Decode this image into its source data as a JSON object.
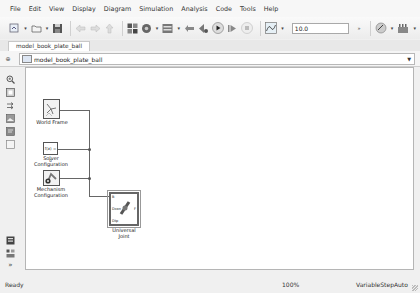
{
  "menubar": {
    "items": [
      {
        "label": "File",
        "mnemonic": "F"
      },
      {
        "label": "Edit",
        "mnemonic": "E"
      },
      {
        "label": "View",
        "mnemonic": "V"
      },
      {
        "label": "Display",
        "mnemonic": "D"
      },
      {
        "label": "Diagram",
        "mnemonic": "g"
      },
      {
        "label": "Simulation",
        "mnemonic": "S"
      },
      {
        "label": "Analysis",
        "mnemonic": "A"
      },
      {
        "label": "Code",
        "mnemonic": "C"
      },
      {
        "label": "Tools",
        "mnemonic": "T"
      },
      {
        "label": "Help",
        "mnemonic": "H"
      }
    ]
  },
  "toolbar": {
    "icons": [
      "new-model-icon",
      "open-icon",
      "save-icon",
      "back-icon",
      "forward-icon",
      "up-icon",
      "library-browser-icon",
      "model-config-icon",
      "model-explorer-icon",
      "step-back-icon",
      "step-back-alt-icon",
      "run-icon",
      "step-forward-icon",
      "stop-icon",
      "data-inspector-icon",
      "fast-restart-icon",
      "build-icon"
    ],
    "stop_time": "10.0"
  },
  "tabs": [
    {
      "label": "model_book_plate_ball",
      "active": true
    }
  ],
  "address_bar": {
    "path": "model_book_plate_ball"
  },
  "palette": {
    "top_icons": [
      "zoom-icon",
      "fit-view-icon",
      "arrow-icon",
      "image-icon",
      "annotation-icon",
      "area-icon"
    ],
    "bottom_icons": [
      "model-browser-icon",
      "property-inspector-icon",
      "expand-icon"
    ],
    "expand_glyph": "»"
  },
  "blocks": {
    "world_frame": {
      "label": "World Frame"
    },
    "solver": {
      "label_line1": "Solver",
      "label_line2": "Configuration",
      "content": "f(x) = 0"
    },
    "mechanism": {
      "label_line1": "Mechanism",
      "label_line2": "Configuration"
    },
    "universal_joint": {
      "label_line1": "Universal",
      "label_line2": "Joint",
      "port_b": "B",
      "port_f": "F",
      "port_dcon": "Dcon",
      "port_dtp": "Dtp"
    }
  },
  "status": {
    "state": "Ready",
    "zoom": "100%",
    "solver": "VariableStepAuto"
  }
}
